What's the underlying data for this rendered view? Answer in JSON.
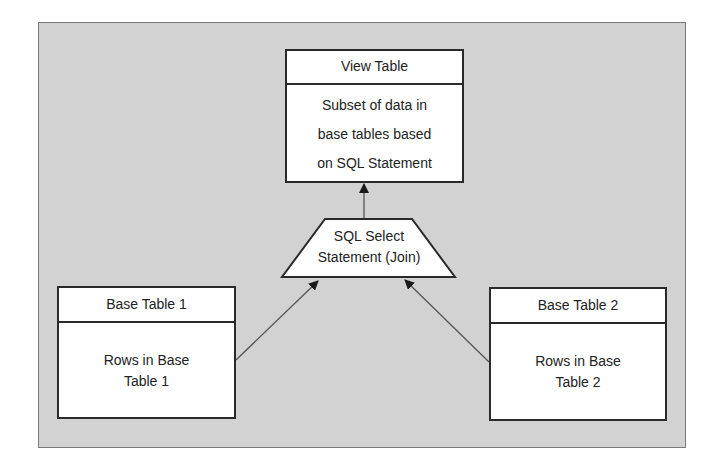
{
  "diagram": {
    "view_table": {
      "title": "View Table",
      "description_lines": [
        "Subset of data in",
        "base tables based",
        "on SQL Statement"
      ]
    },
    "sql_statement": {
      "lines": [
        "SQL Select",
        "Statement (Join)"
      ]
    },
    "base_table_1": {
      "title": "Base Table 1",
      "description_lines": [
        "Rows in Base",
        "Table 1"
      ]
    },
    "base_table_2": {
      "title": "Base Table 2",
      "description_lines": [
        "Rows in Base",
        "Table 2"
      ]
    },
    "edges": [
      {
        "from": "Base Table 1",
        "to": "SQL Select Statement (Join)"
      },
      {
        "from": "Base Table 2",
        "to": "SQL Select Statement (Join)"
      },
      {
        "from": "SQL Select Statement (Join)",
        "to": "View Table"
      }
    ],
    "colors": {
      "background_panel": "#d2d2d2",
      "box_fill": "#ffffff",
      "box_border": "#2a2a2a",
      "arrow": "#555555"
    }
  }
}
